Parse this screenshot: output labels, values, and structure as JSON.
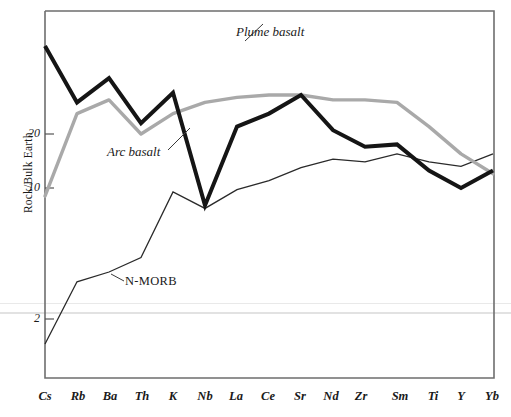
{
  "chart_data": {
    "type": "line",
    "title": "",
    "xlabel": "",
    "ylabel": "Rock/Bulk Earth",
    "y_scale": "log",
    "yticks": [
      2,
      10,
      20
    ],
    "ytick_labels": [
      "2",
      "10",
      "20"
    ],
    "ylim": [
      1.0,
      70
    ],
    "grid": false,
    "legend_position": "inline-annotations",
    "categories": [
      "Cs",
      "Rb",
      "Ba",
      "Th",
      "K",
      "Nb",
      "La",
      "Ce",
      "Sr",
      "Nd",
      "Zr",
      "Sm",
      "Ti",
      "Y",
      "Yb"
    ],
    "series": [
      {
        "name": "Arc basalt",
        "style": "thick-black",
        "color": "#151515",
        "values": [
          62,
          30,
          41,
          23,
          34,
          8.0,
          22,
          26,
          33,
          21,
          17,
          17.5,
          12.5,
          10.0,
          12.5
        ]
      },
      {
        "name": "Plume basalt",
        "style": "thick-gray",
        "color": "#a9a9a9",
        "values": [
          9.0,
          26,
          31,
          20,
          26,
          30,
          32,
          33,
          33,
          31,
          31,
          30,
          22,
          15.5,
          12.0
        ]
      },
      {
        "name": "N-MORB",
        "style": "thin-black",
        "color": "#2a2a2a",
        "values": [
          1.35,
          3.0,
          3.4,
          4.1,
          9.5,
          7.7,
          9.8,
          11.0,
          13.0,
          14.5,
          14.0,
          15.5,
          14.0,
          13.2,
          15.5
        ]
      }
    ],
    "annotations": [
      {
        "text": "Plume basalt",
        "series": "Plume basalt"
      },
      {
        "text": "Arc basalt",
        "series": "Arc basalt"
      },
      {
        "text": "N-MORB",
        "series": "N-MORB"
      }
    ]
  },
  "axis": {
    "y_title": "Rock/Bulk Earth",
    "ytick_0": "2",
    "ytick_1": "10",
    "ytick_2": "20",
    "xtick_0": "Cs",
    "xtick_1": "Rb",
    "xtick_2": "Ba",
    "xtick_3": "Th",
    "xtick_4": "K",
    "xtick_5": "Nb",
    "xtick_6": "La",
    "xtick_7": "Ce",
    "xtick_8": "Sr",
    "xtick_9": "Nd",
    "xtick_10": "Zr",
    "xtick_11": "Sm",
    "xtick_12": "Ti",
    "xtick_13": "Y",
    "xtick_14": "Yb"
  },
  "annotations": {
    "plume_basalt": "Plume basalt",
    "arc_basalt": "Arc basalt",
    "n_morb": "N-MORB"
  },
  "colors": {
    "arc_basalt": "#151515",
    "plume_basalt": "#a9a9a9",
    "n_morb": "#2a2a2a",
    "frame": "#6e6e6e"
  }
}
